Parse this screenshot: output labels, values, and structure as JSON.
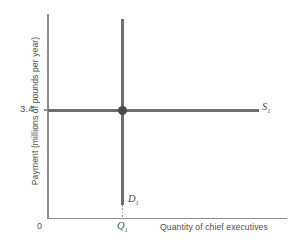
{
  "figure": {
    "type": "economics-diagram",
    "background_color": "#ffffff",
    "line_color": "#6e6e6e",
    "axis_color": "#8d8d8d",
    "text_color": "#4d4d4d"
  },
  "axes": {
    "ylabel": "Payment (millions of pounds per year)",
    "xlabel": "Quantity of chief executives",
    "origin_label": "0",
    "y_tick_labels": [
      "3.4"
    ],
    "x_tick_labels": [
      "Q"
    ],
    "x_tick_subscripts": [
      "1"
    ]
  },
  "curves": {
    "demand": {
      "name": "D",
      "subscript": "1",
      "orientation": "vertical"
    },
    "supply": {
      "name": "S",
      "subscript": "1",
      "orientation": "horizontal"
    }
  },
  "chart_data": {
    "type": "line",
    "title": "",
    "subtitle": "",
    "xlabel": "Quantity of chief executives",
    "ylabel": "Payment (millions of pounds per year)",
    "xlim": [
      0,
      1
    ],
    "ylim": [
      0,
      1
    ],
    "grid": false,
    "legend": "inline-curve-labels",
    "xticks": [
      0.32
    ],
    "xticklabels": [
      "Q1"
    ],
    "yticks": [
      0.53
    ],
    "yticklabels": [
      "3.4"
    ],
    "series": [
      {
        "name": "D1",
        "label": "D₁",
        "type": "vertical-line",
        "description": "Perfectly inelastic demand for chief executives",
        "x": [
          0.32,
          0.32
        ],
        "y": [
          0.065,
          0.98
        ],
        "color": "#6e6e6e"
      },
      {
        "name": "S1",
        "label": "S₁",
        "type": "horizontal-line",
        "description": "Perfectly elastic supply of chief executives at 3.4",
        "x": [
          0.0,
          0.88
        ],
        "y": [
          0.53,
          0.53
        ],
        "color": "#6e6e6e"
      }
    ],
    "annotations": [
      {
        "name": "equilibrium-point",
        "x": 0.32,
        "y": 0.53,
        "marker": "filled-circle",
        "color": "#4a4a4a"
      }
    ]
  }
}
